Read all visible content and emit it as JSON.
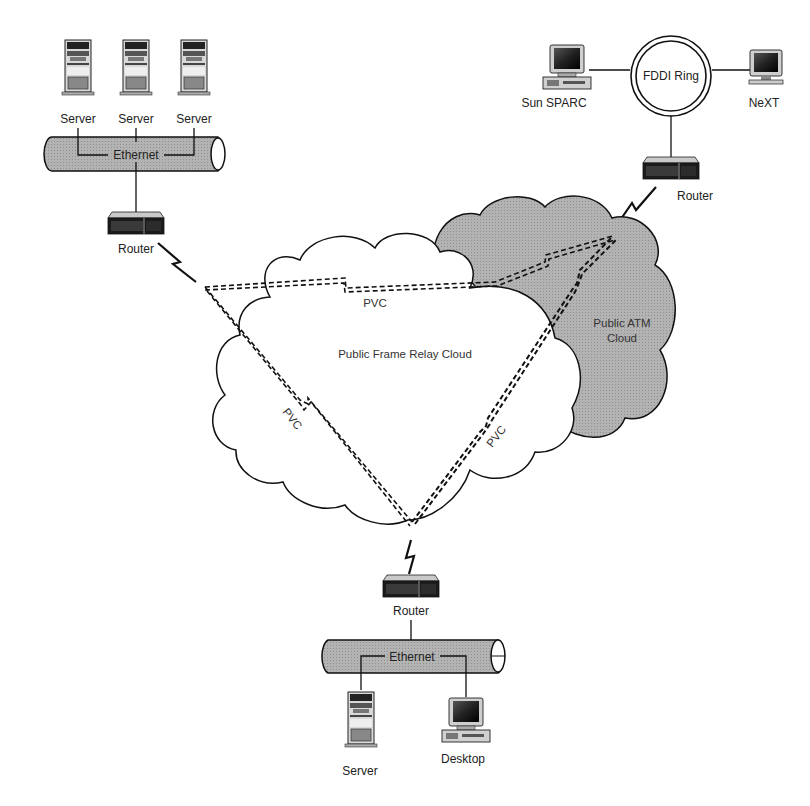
{
  "diagram": {
    "colors": {
      "line": "#1a1a1a",
      "pipe_fill": "#b8b8b8",
      "atm_cloud_fill": "#a9a9a9",
      "frame_cloud_fill": "#ffffff"
    },
    "top_left_site": {
      "servers": [
        {
          "label": "Server"
        },
        {
          "label": "Server"
        },
        {
          "label": "Server"
        }
      ],
      "lan_label": "Ethernet",
      "router_label": "Router"
    },
    "top_right_site": {
      "ring_label": "FDDI Ring",
      "left_host_label": "Sun SPARC",
      "right_host_label": "NeXT",
      "router_label": "Router"
    },
    "bottom_site": {
      "router_label": "Router",
      "lan_label": "Ethernet",
      "server_label": "Server",
      "desktop_label": "Desktop"
    },
    "clouds": {
      "frame_relay": "Public Frame Relay Cloud",
      "atm_line1": "Public ATM",
      "atm_line2": "Cloud"
    },
    "pvcs": [
      {
        "label": "PVC",
        "between": "top-left router — top-right router"
      },
      {
        "label": "PVC",
        "between": "top-left router — bottom router"
      },
      {
        "label": "PVC",
        "between": "bottom router — top-right router"
      }
    ]
  }
}
